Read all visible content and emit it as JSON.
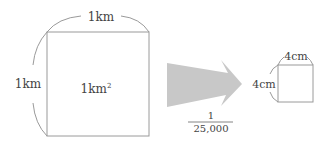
{
  "diagram": {
    "large_square": {
      "top_label": "1km",
      "side_label": "1km",
      "area_label": "1km",
      "area_superscript": "2"
    },
    "arrow": {
      "scale_numerator": "1",
      "scale_denominator": "25,000"
    },
    "small_square": {
      "top_label": "4cm",
      "side_label": "4cm"
    },
    "colors": {
      "line": "#9a9a9a",
      "arrow_fill": "#c8c8c8",
      "text": "#444444"
    }
  }
}
